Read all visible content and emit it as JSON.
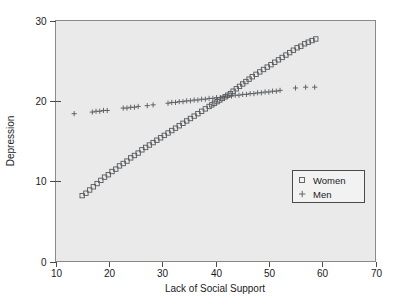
{
  "chart_data": {
    "type": "scatter",
    "title": "",
    "xlabel": "Lack of Social Support",
    "ylabel": "Depression",
    "xlim": [
      10,
      70
    ],
    "ylim": [
      0,
      30
    ],
    "xticks": [
      10,
      20,
      30,
      40,
      50,
      60,
      70
    ],
    "yticks": [
      0,
      10,
      20,
      30
    ],
    "xtick_labels": [
      "10",
      "20",
      "30",
      "40",
      "50",
      "60",
      "70"
    ],
    "ytick_labels": [
      "0",
      "10",
      "20",
      "30"
    ],
    "grid": false,
    "legend_position": "lower right",
    "series": [
      {
        "name": "Women",
        "marker": "square",
        "points": [
          [
            15.0,
            8.2
          ],
          [
            15.7,
            8.5
          ],
          [
            16.4,
            8.9
          ],
          [
            17.1,
            9.3
          ],
          [
            17.8,
            9.7
          ],
          [
            18.5,
            10.1
          ],
          [
            19.2,
            10.5
          ],
          [
            19.9,
            10.8
          ],
          [
            20.6,
            11.2
          ],
          [
            21.3,
            11.5
          ],
          [
            22.0,
            11.9
          ],
          [
            22.7,
            12.2
          ],
          [
            23.4,
            12.5
          ],
          [
            24.1,
            12.9
          ],
          [
            24.8,
            13.2
          ],
          [
            25.5,
            13.5
          ],
          [
            26.2,
            13.9
          ],
          [
            26.9,
            14.2
          ],
          [
            27.6,
            14.5
          ],
          [
            28.3,
            14.8
          ],
          [
            29.0,
            15.1
          ],
          [
            29.7,
            15.4
          ],
          [
            30.4,
            15.7
          ],
          [
            31.1,
            16.0
          ],
          [
            31.8,
            16.3
          ],
          [
            32.5,
            16.6
          ],
          [
            33.2,
            16.9
          ],
          [
            33.9,
            17.2
          ],
          [
            34.6,
            17.5
          ],
          [
            35.3,
            17.8
          ],
          [
            36.0,
            18.1
          ],
          [
            36.7,
            18.4
          ],
          [
            37.4,
            18.7
          ],
          [
            38.1,
            19.0
          ],
          [
            38.8,
            19.3
          ],
          [
            39.3,
            19.5
          ],
          [
            39.8,
            19.7
          ],
          [
            40.3,
            19.9
          ],
          [
            40.8,
            20.1
          ],
          [
            41.3,
            20.3
          ],
          [
            41.8,
            20.5
          ],
          [
            42.3,
            20.7
          ],
          [
            42.8,
            20.9
          ],
          [
            43.3,
            21.2
          ],
          [
            43.9,
            21.5
          ],
          [
            44.5,
            21.8
          ],
          [
            45.1,
            22.1
          ],
          [
            45.7,
            22.4
          ],
          [
            46.3,
            22.7
          ],
          [
            46.9,
            23.0
          ],
          [
            47.6,
            23.3
          ],
          [
            48.3,
            23.6
          ],
          [
            49.0,
            23.9
          ],
          [
            49.7,
            24.2
          ],
          [
            50.4,
            24.5
          ],
          [
            51.1,
            24.8
          ],
          [
            51.8,
            25.1
          ],
          [
            52.5,
            25.4
          ],
          [
            53.2,
            25.7
          ],
          [
            53.9,
            26.0
          ],
          [
            54.6,
            26.3
          ],
          [
            55.3,
            26.6
          ],
          [
            56.0,
            26.8
          ],
          [
            56.7,
            27.1
          ],
          [
            57.4,
            27.3
          ],
          [
            58.1,
            27.5
          ],
          [
            58.8,
            27.7
          ]
        ]
      },
      {
        "name": "Men",
        "marker": "plus",
        "points": [
          [
            13.5,
            18.4
          ],
          [
            16.9,
            18.6
          ],
          [
            17.6,
            18.7
          ],
          [
            18.3,
            18.7
          ],
          [
            19.0,
            18.8
          ],
          [
            19.7,
            18.8
          ],
          [
            22.7,
            19.1
          ],
          [
            23.4,
            19.1
          ],
          [
            24.1,
            19.2
          ],
          [
            24.8,
            19.2
          ],
          [
            25.5,
            19.3
          ],
          [
            27.2,
            19.4
          ],
          [
            28.3,
            19.5
          ],
          [
            31.1,
            19.7
          ],
          [
            31.8,
            19.8
          ],
          [
            32.5,
            19.8
          ],
          [
            33.2,
            19.9
          ],
          [
            33.9,
            19.9
          ],
          [
            34.6,
            20.0
          ],
          [
            35.3,
            20.0
          ],
          [
            36.0,
            20.1
          ],
          [
            36.7,
            20.1
          ],
          [
            37.4,
            20.2
          ],
          [
            38.1,
            20.2
          ],
          [
            38.8,
            20.3
          ],
          [
            39.5,
            20.3
          ],
          [
            40.2,
            20.4
          ],
          [
            40.9,
            20.4
          ],
          [
            41.6,
            20.5
          ],
          [
            42.3,
            20.6
          ],
          [
            43.0,
            20.6
          ],
          [
            43.7,
            20.7
          ],
          [
            44.4,
            20.7
          ],
          [
            45.1,
            20.8
          ],
          [
            45.8,
            20.8
          ],
          [
            46.5,
            20.9
          ],
          [
            47.2,
            20.9
          ],
          [
            47.9,
            21.0
          ],
          [
            48.6,
            21.0
          ],
          [
            49.3,
            21.1
          ],
          [
            50.0,
            21.1
          ],
          [
            50.7,
            21.2
          ],
          [
            51.4,
            21.2
          ],
          [
            52.1,
            21.3
          ],
          [
            55.0,
            21.6
          ],
          [
            56.9,
            21.7
          ],
          [
            58.6,
            21.7
          ]
        ]
      }
    ],
    "legend": [
      {
        "label": "Women",
        "marker": "square"
      },
      {
        "label": "Men",
        "marker": "plus"
      }
    ]
  },
  "colors": {
    "plot_background": "#eaeaea",
    "marker": "#55585c",
    "axis": "#4a4a4a",
    "text": "#1a1a1a",
    "page_background": "#ffffff"
  }
}
